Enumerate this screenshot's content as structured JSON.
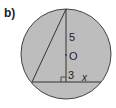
{
  "part_label": "b)",
  "diagram": {
    "segment_upper": "5",
    "center_label": "O",
    "segment_lower": "3",
    "unknown": "x",
    "colors": {
      "fill": "#bdbdbd",
      "stroke": "#333333"
    }
  }
}
